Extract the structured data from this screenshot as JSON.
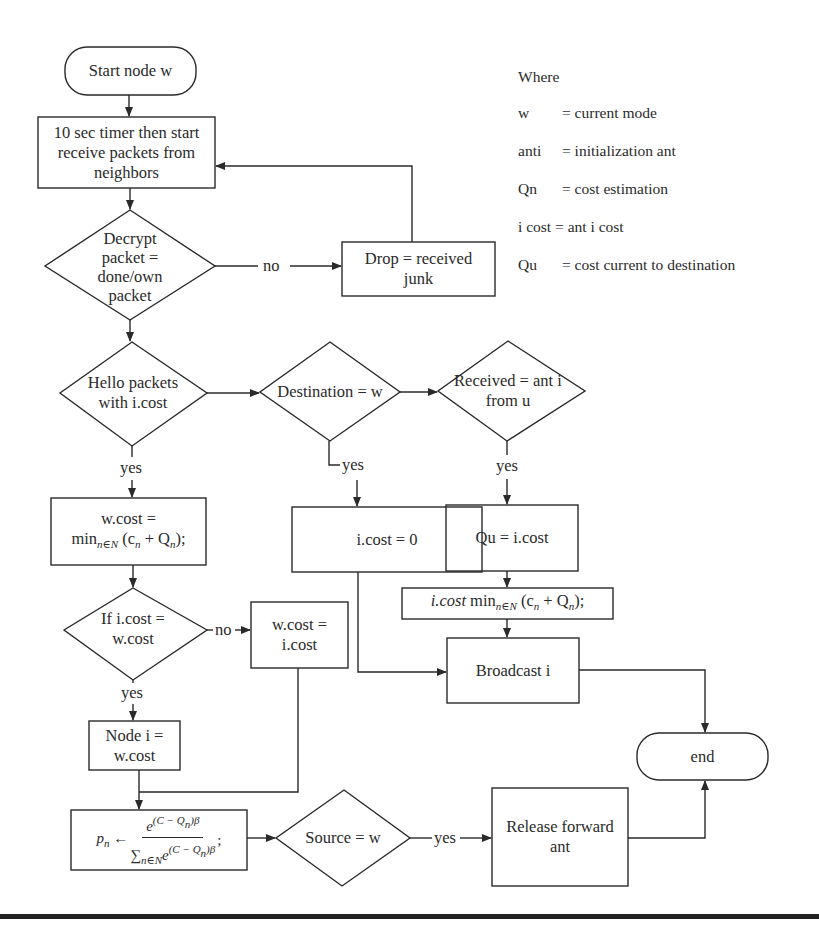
{
  "diagram": {
    "type": "flowchart",
    "colors": {
      "stroke": "#2a2a2a",
      "background": "#ffffff",
      "rule": "#222222"
    },
    "nodes": {
      "start": {
        "shape": "terminator",
        "label": "Start node w"
      },
      "timer": {
        "shape": "process",
        "label": "10 sec timer then start\nreceive packets from\nneighbors"
      },
      "decrypt": {
        "shape": "decision",
        "label": "Decrypt\npacket =\ndone/own\npacket"
      },
      "drop": {
        "shape": "process",
        "label": "Drop = received\njunk"
      },
      "hello": {
        "shape": "decision",
        "label": "Hello packets\nwith i.cost"
      },
      "destination": {
        "shape": "decision",
        "label": "Destination = w"
      },
      "received": {
        "shape": "decision",
        "label": "Received = ant i\nfrom u"
      },
      "wcost_min": {
        "shape": "process",
        "line1": "w.cost =",
        "line2_prefix": "min",
        "line2_sub": "n∈N",
        "line2_rest": "(c",
        "line2_c_sub": "n",
        "line2_plus": " + Q",
        "line2_q_sub": "n",
        "line2_end": ");"
      },
      "icost_zero": {
        "shape": "process",
        "label": "i.cost = 0"
      },
      "qu": {
        "shape": "process",
        "label": "Qu = i.cost"
      },
      "icost_min": {
        "shape": "process",
        "italic": "i.cost",
        "prefix": " min",
        "sub": "n∈N",
        "rest": " (c",
        "c_sub": "n",
        "plus": " + Q",
        "q_sub": "n",
        "end": ");"
      },
      "broadcast": {
        "shape": "process",
        "label": "Broadcast i"
      },
      "if_cost": {
        "shape": "decision",
        "label": "If i.cost =\nw.cost"
      },
      "wcost_icost": {
        "shape": "process",
        "label": "w.cost =\ni.cost"
      },
      "node_i": {
        "shape": "process",
        "label": "Node i =\nw.cost"
      },
      "pn": {
        "shape": "process",
        "lhs": "p",
        "lhs_sub": "n",
        "arrow": " ← ",
        "num": "e",
        "num_sup": "(C − Q",
        "num_sup_sub": "n",
        "num_sup_end": ")β",
        "den_sigma": "∑",
        "den_sub": "n∈N",
        "den_e": "e",
        "den_sup": "(C − Q",
        "den_sup_sub": "n",
        "den_sup_end": ")β",
        "end": ";"
      },
      "source": {
        "shape": "decision",
        "label": "Source = w"
      },
      "release": {
        "shape": "process",
        "label": "Release forward\nant"
      },
      "end": {
        "shape": "terminator",
        "label": "end"
      }
    },
    "edges": [
      {
        "from": "start",
        "to": "timer",
        "label": ""
      },
      {
        "from": "timer",
        "to": "decrypt",
        "label": ""
      },
      {
        "from": "decrypt",
        "to": "drop",
        "label": "no"
      },
      {
        "from": "drop",
        "to": "timer",
        "label": ""
      },
      {
        "from": "decrypt",
        "to": "hello",
        "label": ""
      },
      {
        "from": "hello",
        "to": "destination",
        "label": ""
      },
      {
        "from": "destination",
        "to": "received",
        "label": ""
      },
      {
        "from": "hello",
        "to": "wcost_min",
        "label": "yes"
      },
      {
        "from": "destination",
        "to": "icost_zero",
        "label": "yes"
      },
      {
        "from": "received",
        "to": "qu",
        "label": "yes"
      },
      {
        "from": "qu",
        "to": "icost_min",
        "label": ""
      },
      {
        "from": "icost_min",
        "to": "broadcast",
        "label": ""
      },
      {
        "from": "icost_zero",
        "to": "broadcast",
        "label": ""
      },
      {
        "from": "wcost_min",
        "to": "if_cost",
        "label": ""
      },
      {
        "from": "if_cost",
        "to": "wcost_icost",
        "label": "no"
      },
      {
        "from": "if_cost",
        "to": "node_i",
        "label": "yes"
      },
      {
        "from": "node_i",
        "to": "pn",
        "label": ""
      },
      {
        "from": "wcost_icost",
        "to": "pn",
        "label": ""
      },
      {
        "from": "pn",
        "to": "source",
        "label": ""
      },
      {
        "from": "source",
        "to": "release",
        "label": "yes"
      },
      {
        "from": "broadcast",
        "to": "end",
        "label": ""
      },
      {
        "from": "release",
        "to": "end",
        "label": ""
      }
    ],
    "edge_labels": {
      "decrypt_no": "no",
      "hello_yes": "yes",
      "destination_yes": "yes",
      "received_yes": "yes",
      "if_no": "no",
      "if_yes": "yes",
      "source_yes": "yes"
    }
  },
  "legend": {
    "title": "Where",
    "entries": [
      {
        "term": "w",
        "definition": "= current mode"
      },
      {
        "term": "anti",
        "definition": "= initialization ant"
      },
      {
        "term": "Qn",
        "definition": "= cost estimation"
      },
      {
        "term": "i cost",
        "definition": "= ant i cost"
      },
      {
        "term": "Qu",
        "definition": "= cost current to destination"
      }
    ]
  }
}
